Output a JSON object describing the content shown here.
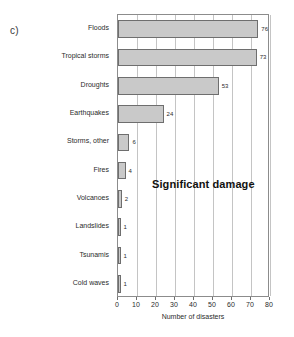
{
  "panel": {
    "label": "c)"
  },
  "annotation": {
    "text": "Significant damage"
  },
  "chart_data": {
    "type": "bar",
    "orientation": "horizontal",
    "title": "",
    "subtitle": "",
    "panel_label": "c)",
    "annotation": "Significant damage",
    "xlabel": "Number of disasters",
    "ylabel": "",
    "xlim": [
      0,
      80
    ],
    "xticks": [
      0,
      10,
      20,
      30,
      40,
      50,
      60,
      70,
      80
    ],
    "xtick_labels": [
      "0",
      "10",
      "20",
      "30",
      "40",
      "50",
      "60",
      "70",
      "80"
    ],
    "grid": "vertical",
    "legend": "none",
    "bar_color": "#c9c9c9",
    "bar_edge_color": "#6e6e6e",
    "categories": [
      "Floods",
      "Tropical storms",
      "Droughts",
      "Earthquakes",
      "Storms, other",
      "Fires",
      "Volcanoes",
      "Landslides",
      "Tsunamis",
      "Cold waves"
    ],
    "values": [
      76,
      73,
      53,
      24,
      6,
      4,
      2,
      1,
      1,
      1
    ],
    "value_labels": [
      "76",
      "73",
      "53",
      "24",
      "6",
      "4",
      "2",
      "1",
      "1",
      "1"
    ]
  }
}
